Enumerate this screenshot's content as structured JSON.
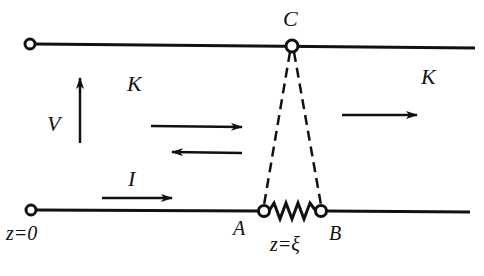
{
  "diagram": {
    "colors": {
      "line": "#111111",
      "background": "#ffffff"
    },
    "labels": {
      "node_c": "C",
      "node_a": "A",
      "node_b": "B",
      "region_left": "K",
      "region_right": "K",
      "voltage": "V",
      "current": "I",
      "origin": "z=0",
      "load_position": "z=ξ"
    },
    "arrows": [
      {
        "id": "voltage-arrow",
        "direction": "up"
      },
      {
        "id": "incident-wave-arrow",
        "direction": "right"
      },
      {
        "id": "reflected-wave-arrow",
        "direction": "left"
      },
      {
        "id": "transmitted-wave-arrow",
        "direction": "right"
      },
      {
        "id": "current-arrow",
        "direction": "right"
      }
    ],
    "elements": {
      "top_conductor": "solid line",
      "bottom_conductor": "solid line with series resistor between A and B",
      "dashed_connections": [
        "C to A",
        "C to B"
      ],
      "terminals": [
        "left top terminal",
        "left bottom terminal (z=0)",
        "C",
        "A",
        "B"
      ]
    }
  }
}
